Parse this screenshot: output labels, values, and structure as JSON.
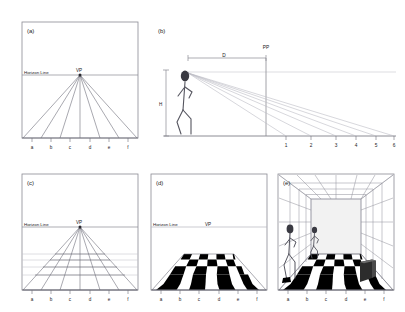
{
  "figure": {
    "background_color": "#ffffff",
    "line_color": "#5a5a66",
    "faint_line_color": "#b9b9c2",
    "border_color": "#8a8a93",
    "ink_color": "#1a1a1a",
    "dark_fill": "#000000"
  },
  "panels": [
    {
      "id": "a",
      "label": "(a)",
      "caption_labels": {
        "horizon": "Horizon Line",
        "vanishing_point": "VP"
      },
      "baseline_ticks": [
        "a",
        "b",
        "c",
        "d",
        "e",
        "f"
      ],
      "description": "Square picture frame with a horizon line and a vanishing point from which six convergence lines radiate down to the baseline tick marks.",
      "num_convergence_lines": 7,
      "horizon_y_fraction": 0.46
    },
    {
      "id": "b",
      "label": "(b)",
      "caption_labels": {
        "distance": "D",
        "height": "H",
        "picture_plane": "PP"
      },
      "ground_ticks": [
        "1",
        "2",
        "3",
        "4",
        "5",
        "6"
      ],
      "description": "Side elevation: a standing observer figure at left, eye-level sight line running right, the picture plane PP at distance D, and ground-plane sight rays striking ground positions 1 through 6.",
      "num_sight_rays": 6,
      "eye_level_y_fraction": 0.42
    },
    {
      "id": "c",
      "label": "(c)",
      "caption_labels": {
        "horizon": "Horizon Line",
        "vanishing_point": "VP"
      },
      "baseline_ticks": [
        "a",
        "b",
        "c",
        "d",
        "e",
        "f"
      ],
      "description": "Same frame as (a) but with transversal horizontal lines added, producing a perspective floor grid that compresses toward the horizon.",
      "num_transversals": 6,
      "horizon_y_fraction": 0.46
    },
    {
      "id": "d",
      "label": "(d)",
      "caption_labels": {
        "horizon": "Horizon Line",
        "vanishing_point": "VP"
      },
      "baseline_ticks": [
        "a",
        "b",
        "c",
        "d",
        "e",
        "f"
      ],
      "description": "The perspective grid of (c) filled in as a black and white checkerboard floor tile pattern.",
      "checker_columns": 6,
      "checker_rows": 6,
      "horizon_y_fraction": 0.46
    },
    {
      "id": "e",
      "label": "(e)",
      "baseline_ticks": [
        "a",
        "b",
        "c",
        "d",
        "e",
        "f"
      ],
      "description": "A complete one-point perspective room: gridded side walls and ceiling, a blank back wall, the checkerboard floor, two walking stick figures at different depths and a dark rectangular block standing on the floor to the right.",
      "figure_count": 2,
      "has_block_object": true
    }
  ]
}
